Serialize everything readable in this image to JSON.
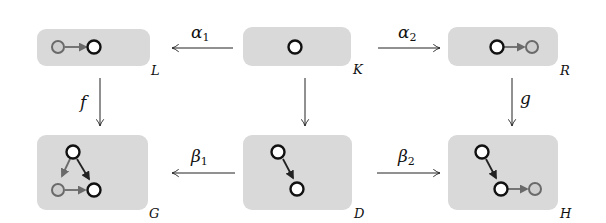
{
  "diagram": {
    "objects": {
      "L": {
        "label": "L"
      },
      "K": {
        "label": "K"
      },
      "R": {
        "label": "R"
      },
      "G": {
        "label": "G"
      },
      "D": {
        "label": "D"
      },
      "H": {
        "label": "H"
      }
    },
    "morphisms": {
      "alpha1": {
        "base": "α",
        "sub": "1",
        "from": "K",
        "to": "L"
      },
      "alpha2": {
        "base": "α",
        "sub": "2",
        "from": "K",
        "to": "R"
      },
      "beta1": {
        "base": "β",
        "sub": "1",
        "from": "D",
        "to": "G"
      },
      "beta2": {
        "base": "β",
        "sub": "2",
        "from": "D",
        "to": "H"
      },
      "f": {
        "label": "f",
        "from": "L",
        "to": "G"
      },
      "g": {
        "label": "g",
        "from": "R",
        "to": "H"
      },
      "k": {
        "label": "",
        "from": "K",
        "to": "D"
      }
    },
    "colors": {
      "box_fill": "#d9d9d9",
      "node_dark": "#111111",
      "node_grey": "#6a6a6a"
    }
  }
}
